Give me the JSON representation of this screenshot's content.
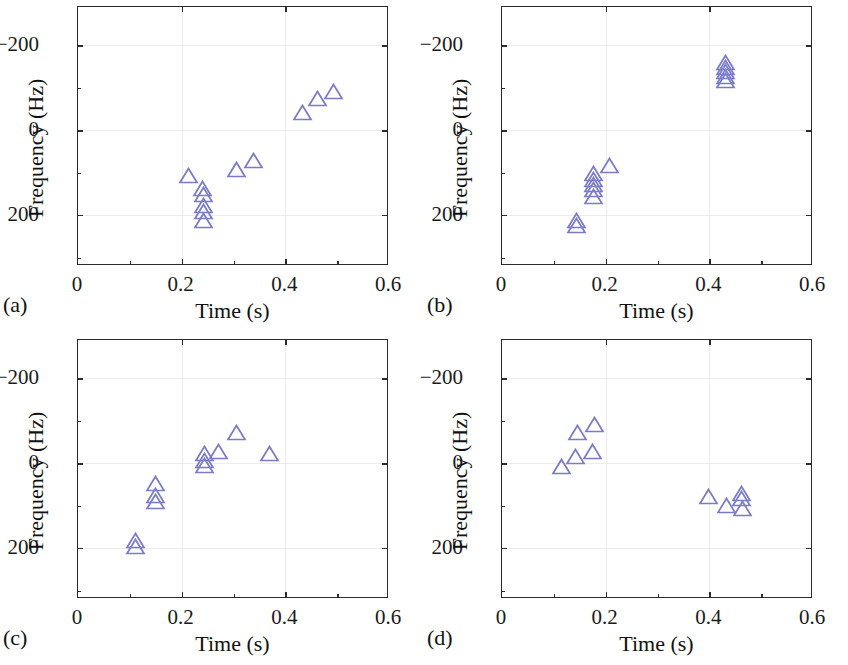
{
  "figure": {
    "panel_count": 4,
    "marker_color": "#7b7bc8",
    "frame_color": "#2b2b2b",
    "grid_color": "#ebebf2",
    "marker_shape": "open-triangle"
  },
  "axes": {
    "xlabel": "Time (s)",
    "ylabel": "Frequency (Hz)",
    "xticks": [
      "0",
      "0.2",
      "0.4",
      "0.6"
    ],
    "xtick_values": [
      0,
      0.2,
      0.4,
      0.6
    ],
    "yticks": [
      "200",
      "0",
      "−200"
    ],
    "ytick_values": [
      200,
      0,
      -200
    ],
    "xlim": [
      0,
      0.6
    ],
    "ylim": [
      -320,
      290
    ]
  },
  "panels": [
    {
      "id": "a",
      "tag": "(a)"
    },
    {
      "id": "b",
      "tag": "(b)"
    },
    {
      "id": "c",
      "tag": "(c)"
    },
    {
      "id": "d",
      "tag": "(d)"
    }
  ],
  "chart_data": [
    {
      "type": "scatter",
      "panel": "(a)",
      "title": "",
      "xlabel": "Time (s)",
      "ylabel": "Frequency (Hz)",
      "xlim": [
        0,
        0.6
      ],
      "ylim": [
        -320,
        290
      ],
      "xticks": [
        0,
        0.2,
        0.4,
        0.6
      ],
      "yticks": [
        -200,
        0,
        200
      ],
      "grid": true,
      "legend": null,
      "marker": "open-triangle",
      "color": "#7b7bc8",
      "points": [
        {
          "x": 0.195,
          "y": -88
        },
        {
          "x": 0.222,
          "y": -118
        },
        {
          "x": 0.224,
          "y": -132
        },
        {
          "x": 0.224,
          "y": -158
        },
        {
          "x": 0.224,
          "y": -172
        },
        {
          "x": 0.224,
          "y": -192
        },
        {
          "x": 0.288,
          "y": -72
        },
        {
          "x": 0.32,
          "y": -52
        },
        {
          "x": 0.414,
          "y": 62
        },
        {
          "x": 0.444,
          "y": 95
        },
        {
          "x": 0.474,
          "y": 112
        }
      ]
    },
    {
      "type": "scatter",
      "panel": "(b)",
      "title": "",
      "xlabel": "Time (s)",
      "ylabel": "Frequency (Hz)",
      "xlim": [
        0,
        0.6
      ],
      "ylim": [
        -320,
        290
      ],
      "xticks": [
        0,
        0.2,
        0.4,
        0.6
      ],
      "yticks": [
        -200,
        0,
        200
      ],
      "grid": true,
      "legend": null,
      "marker": "open-triangle",
      "color": "#7b7bc8",
      "points": [
        {
          "x": 0.125,
          "y": -192
        },
        {
          "x": 0.125,
          "y": -205
        },
        {
          "x": 0.158,
          "y": -82
        },
        {
          "x": 0.158,
          "y": -96
        },
        {
          "x": 0.158,
          "y": -108
        },
        {
          "x": 0.158,
          "y": -120
        },
        {
          "x": 0.158,
          "y": -136
        },
        {
          "x": 0.19,
          "y": -64
        },
        {
          "x": 0.412,
          "y": 180
        },
        {
          "x": 0.412,
          "y": 168
        },
        {
          "x": 0.412,
          "y": 158
        },
        {
          "x": 0.412,
          "y": 146
        },
        {
          "x": 0.412,
          "y": 136
        }
      ]
    },
    {
      "type": "scatter",
      "panel": "(c)",
      "title": "",
      "xlabel": "Time (s)",
      "ylabel": "Frequency (Hz)",
      "xlim": [
        0,
        0.6
      ],
      "ylim": [
        -320,
        290
      ],
      "xticks": [
        0,
        0.2,
        0.4,
        0.6
      ],
      "yticks": [
        -200,
        0,
        200
      ],
      "grid": true,
      "legend": null,
      "marker": "open-triangle",
      "color": "#7b7bc8",
      "points": [
        {
          "x": 0.093,
          "y": -162
        },
        {
          "x": 0.093,
          "y": -176
        },
        {
          "x": 0.131,
          "y": -28
        },
        {
          "x": 0.131,
          "y": -56
        },
        {
          "x": 0.131,
          "y": -70
        },
        {
          "x": 0.225,
          "y": 42
        },
        {
          "x": 0.225,
          "y": 26
        },
        {
          "x": 0.225,
          "y": 14
        },
        {
          "x": 0.252,
          "y": 48
        },
        {
          "x": 0.288,
          "y": 92
        },
        {
          "x": 0.352,
          "y": 42
        }
      ]
    },
    {
      "type": "scatter",
      "panel": "(d)",
      "title": "",
      "xlabel": "Time (s)",
      "ylabel": "Frequency (Hz)",
      "xlim": [
        0,
        0.6
      ],
      "ylim": [
        -320,
        290
      ],
      "xticks": [
        0,
        0.2,
        0.4,
        0.6
      ],
      "yticks": [
        -200,
        0,
        200
      ],
      "grid": true,
      "legend": null,
      "marker": "open-triangle",
      "color": "#7b7bc8",
      "points": [
        {
          "x": 0.096,
          "y": 12
        },
        {
          "x": 0.124,
          "y": 36
        },
        {
          "x": 0.128,
          "y": 92
        },
        {
          "x": 0.156,
          "y": 48
        },
        {
          "x": 0.16,
          "y": 112
        },
        {
          "x": 0.38,
          "y": -58
        },
        {
          "x": 0.414,
          "y": -80
        },
        {
          "x": 0.444,
          "y": -52
        },
        {
          "x": 0.444,
          "y": -64
        },
        {
          "x": 0.446,
          "y": -88
        }
      ]
    }
  ]
}
